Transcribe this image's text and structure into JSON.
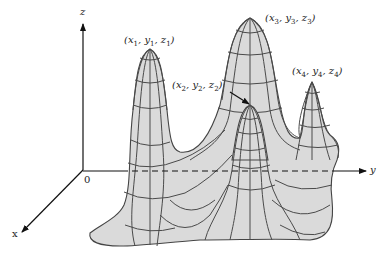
{
  "diagram": {
    "type": "3d-surface-with-local-maxima",
    "axes": {
      "x_label": "x",
      "y_label": "y",
      "z_label": "z",
      "origin_label": "0"
    },
    "points": [
      {
        "id": 1,
        "label_parts": [
          "x",
          "1",
          "y",
          "1",
          "z",
          "1"
        ]
      },
      {
        "id": 2,
        "label_parts": [
          "x",
          "2",
          "y",
          "2",
          "z",
          "2"
        ]
      },
      {
        "id": 3,
        "label_parts": [
          "x",
          "3",
          "y",
          "3",
          "z",
          "3"
        ]
      },
      {
        "id": 4,
        "label_parts": [
          "x",
          "4",
          "y",
          "4",
          "z",
          "4"
        ]
      }
    ],
    "colors": {
      "surface_fill": "#dadada",
      "grid_lines": "#4a4a4a",
      "axes": "#111111"
    }
  }
}
